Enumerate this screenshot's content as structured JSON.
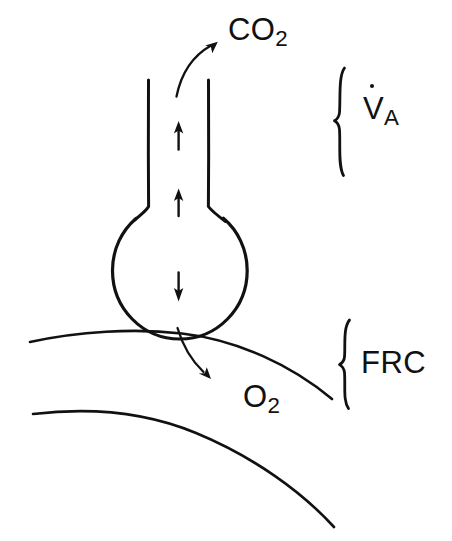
{
  "figure": {
    "background_color": "#ffffff",
    "ink_color": "#111111",
    "width": 452,
    "height": 541
  },
  "labels": {
    "co2": {
      "base": "CO",
      "sub": "2",
      "full": "CO2"
    },
    "o2": {
      "base": "O",
      "sub": "2",
      "full": "O2"
    },
    "va": {
      "base": "V",
      "sub": "A",
      "full": "VA",
      "has_overdot": true
    },
    "frc": {
      "text": "FRC"
    }
  },
  "annotations": {
    "brace_upper_label": "VA",
    "brace_lower_label": "FRC",
    "arrow_up_count": 2,
    "arrow_down_count": 1,
    "curved_arrow_out": "CO2",
    "curved_arrow_in": "O2"
  },
  "parts": {
    "alveolus": "alveolus-circle",
    "airway": "airway-tube",
    "membrane_upper": "chest-wall-upper-curve",
    "membrane_lower": "chest-wall-lower-curve"
  }
}
